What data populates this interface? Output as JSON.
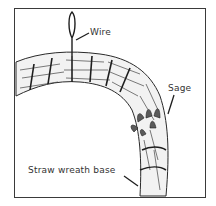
{
  "figure": {
    "labels": {
      "wire": "Wire",
      "sage": "Sage",
      "base": "Straw wreath base"
    },
    "colors": {
      "ink": "#2a2a2a",
      "frame": "#3a3a3a",
      "background": "#ffffff"
    }
  }
}
